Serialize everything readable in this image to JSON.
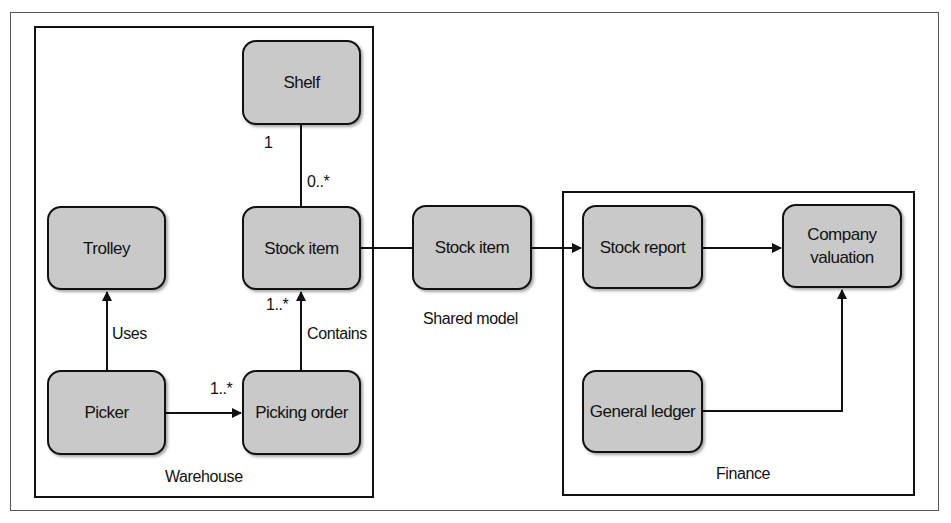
{
  "contexts": {
    "warehouse": {
      "label": "Warehouse"
    },
    "shared": {
      "label": "Shared model"
    },
    "finance": {
      "label": "Finance"
    }
  },
  "nodes": {
    "shelf": "Shelf",
    "stock_item_warehouse": "Stock item",
    "trolley": "Trolley",
    "picker": "Picker",
    "picking_order": "Picking order",
    "stock_item_shared": "Stock item",
    "stock_report": "Stock report",
    "company_valuation_line1": "Company",
    "company_valuation_line2": "valuation",
    "general_ledger": "General ledger"
  },
  "edges": {
    "shelf_stock": {
      "from": "Shelf",
      "to": "Stock item",
      "from_multiplicity": "1",
      "to_multiplicity": "0..*"
    },
    "picker_trolley": {
      "from": "Picker",
      "to": "Trolley",
      "label": "Uses"
    },
    "picker_order": {
      "from": "Picker",
      "to": "Picking order",
      "multiplicity": "1..*"
    },
    "order_stock": {
      "from": "Picking order",
      "to": "Stock item",
      "label": "Contains",
      "multiplicity": "1..*"
    },
    "warehouse_shared": {
      "from": "Stock item",
      "to": "Stock item (Shared model)"
    },
    "shared_report": {
      "from": "Stock item (Shared model)",
      "to": "Stock report"
    },
    "report_valuation": {
      "from": "Stock report",
      "to": "Company valuation"
    },
    "ledger_valuation": {
      "from": "General ledger",
      "to": "Company valuation"
    }
  }
}
